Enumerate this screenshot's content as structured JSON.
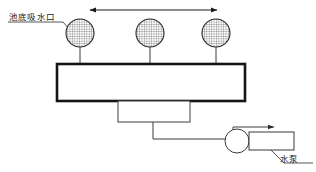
{
  "diagram": {
    "canvas": {
      "width": 316,
      "height": 172,
      "background": "#ffffff"
    },
    "labels": {
      "suction_port": "池底吸水口",
      "water_pump": "水泵"
    },
    "icons": {
      "suction_port": "hatched-circle-icon",
      "pump": "pump-circle-icon",
      "dimension_arrow": "double-headed-arrow-icon",
      "flow_arrow": "flow-arrow-icon"
    },
    "suction_ports": [
      {
        "id": "port-1",
        "cx": 80,
        "cy": 33,
        "r": 14
      },
      {
        "id": "port-2",
        "cx": 150,
        "cy": 33,
        "r": 14
      },
      {
        "id": "port-3",
        "cx": 216,
        "cy": 33,
        "r": 14
      }
    ],
    "tank": {
      "x": 57,
      "y": 64,
      "width": 188,
      "height": 37
    },
    "manifold_box": {
      "x": 118,
      "y": 101,
      "width": 72,
      "height": 21
    },
    "dimension_arrow": {
      "x1": 90,
      "x2": 217,
      "y": 10
    },
    "pump": {
      "circle": {
        "cx": 237,
        "cy": 141,
        "r": 12
      },
      "box": {
        "x": 249,
        "y": 132,
        "width": 45,
        "height": 18
      },
      "discharge_arrow": {
        "x1": 233,
        "y1": 127,
        "x2": 277,
        "y2": 127
      }
    },
    "colors": {
      "line": "#2b2b2b",
      "tank_border": "#151515",
      "hatch": "#4a4a4a",
      "text": "#1a1a1a",
      "background": "#ffffff"
    }
  }
}
